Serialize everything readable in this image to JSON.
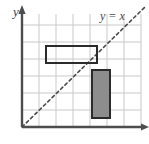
{
  "figure": {
    "background_color": "#ffffff",
    "width": 149,
    "height": 144
  },
  "axes": {
    "y_axis_label": "y",
    "y_axis_label_color": "#3a3a3a",
    "axis_color": "#4d4d4d",
    "origin_px": {
      "x": 22,
      "y": 127
    },
    "y_axis_top_px": 9,
    "x_axis_right_px": 146,
    "arrowheads": [
      "y-axis-up",
      "x-axis-right"
    ]
  },
  "grid": {
    "color": "#c9c9c9",
    "spacing_px": 17,
    "columns": 7,
    "rows": 7,
    "left_px": 22,
    "top_px": 14,
    "right_px": 141,
    "bottom_px": 127,
    "visible": true
  },
  "line": {
    "label": "y = x",
    "label_color": "#4a4a4a",
    "style": "dashed",
    "color": "#4a4a4a",
    "dash_pattern": "3 3",
    "start_px": {
      "x": 22,
      "y": 127
    },
    "end_px": {
      "x": 146,
      "y": 6
    },
    "equation_slope": 1,
    "equation_intercept": 0
  },
  "shapes": [
    {
      "name": "preimage-rectangle",
      "fill": "none",
      "fill_label": "unfilled",
      "stroke": "#2b2b2b",
      "stroke_width": 2,
      "x_px": 46,
      "y_px": 46,
      "width_px": 51,
      "height_px": 17,
      "grid_units": {
        "x": 1.4,
        "y": 3.8,
        "width": 3,
        "height": 1
      },
      "position": "above the line y = x"
    },
    {
      "name": "image-rectangle",
      "fill": "#8d8d8d",
      "fill_label": "gray",
      "stroke": "#2b2b2b",
      "stroke_width": 2,
      "x_px": 92,
      "y_px": 70,
      "width_px": 18,
      "height_px": 48,
      "grid_units": {
        "x": 4.1,
        "y": 0.5,
        "width": 1,
        "height": 3
      },
      "position": "below the line y = x"
    }
  ]
}
